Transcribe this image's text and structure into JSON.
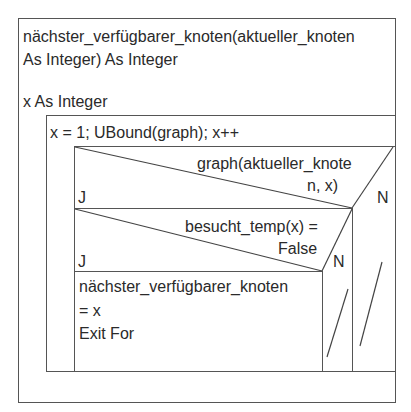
{
  "function": {
    "signature_line1": "nächster_verfügbarer_knoten(aktueller_knoten",
    "signature_line2": "As Integer) As Integer",
    "declaration": "x As Integer"
  },
  "loop": {
    "header": "x = 1; UBound(graph); x++"
  },
  "if_outer": {
    "condition_line1": "graph(aktueller_knote",
    "condition_line2": "n, x)",
    "yes_label": "J",
    "no_label": "N"
  },
  "if_inner": {
    "condition_line1": "besucht_temp(x) =",
    "condition_line2": "False",
    "yes_label": "J",
    "no_label": "N"
  },
  "action": {
    "line1": "nächster_verfügbarer_knoten",
    "line2": "= x",
    "line3": "Exit For"
  }
}
